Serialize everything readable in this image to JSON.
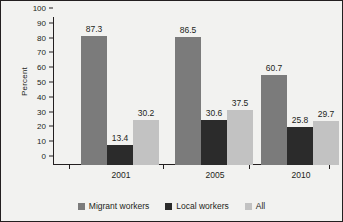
{
  "chart_data": {
    "type": "bar",
    "title": "",
    "xlabel": "",
    "ylabel": "Percent",
    "categories": [
      "2001",
      "2005",
      "2010"
    ],
    "series": [
      {
        "name": "Migrant workers",
        "color": "#7b7b7b",
        "values": [
          87.3,
          86.5,
          60.7
        ]
      },
      {
        "name": "Local workers",
        "color": "#2b2b2b",
        "values": [
          13.4,
          30.6,
          25.8
        ]
      },
      {
        "name": "All",
        "color": "#c2c2c2",
        "values": [
          30.2,
          37.5,
          29.7
        ]
      }
    ],
    "ylim": [
      0,
      100
    ],
    "yticks": [
      0,
      10,
      20,
      30,
      40,
      50,
      60,
      70,
      80,
      90,
      100
    ],
    "ytick_labels": [
      "0",
      "10",
      "20",
      "30",
      "40",
      "50",
      "60",
      "70",
      "80",
      "90",
      "100"
    ],
    "grid": false,
    "legend_position": "bottom",
    "data_labels": [
      [
        "87.3",
        "13.4",
        "30.2"
      ],
      [
        "86.5",
        "30.6",
        "37.5"
      ],
      [
        "60.7",
        "25.8",
        "29.7"
      ]
    ]
  },
  "colors": {
    "frame_border": "#231f20",
    "background": "#f2f2f0",
    "axis": "#231f20",
    "text": "#231f20"
  }
}
